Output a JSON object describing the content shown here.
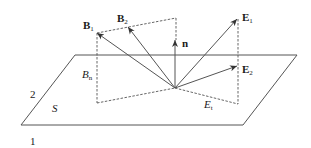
{
  "diagram": {
    "regions": {
      "medium_top": "2",
      "medium_bottom": "1",
      "surface": "S"
    },
    "vectors": {
      "B1": {
        "base": "B",
        "sub": "1"
      },
      "B2": {
        "base": "B",
        "sub": "2"
      },
      "n": {
        "base": "n"
      },
      "E1": {
        "base": "E",
        "sub": "1"
      },
      "E2": {
        "base": "E",
        "sub": "2"
      }
    },
    "components": {
      "Bn": {
        "base": "B",
        "sub": "n"
      },
      "Et": {
        "base": "E",
        "sub": "t"
      }
    },
    "colors": {
      "line": "#555555",
      "text": "#1a1a1a",
      "background": "#ffffff"
    }
  }
}
